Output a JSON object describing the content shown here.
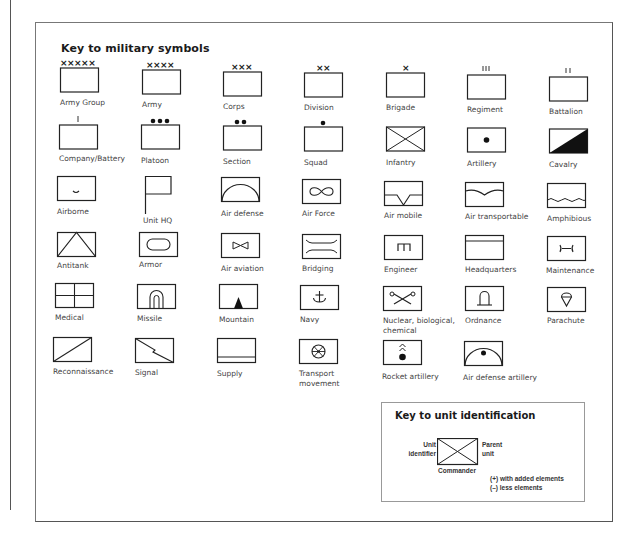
{
  "title": "Key to military symbols",
  "symbols": [
    {
      "id": "army-group",
      "label": "Army Group",
      "icon": "army-group-icon",
      "marker": "xxxxx"
    },
    {
      "id": "army",
      "label": "Army",
      "icon": "army-icon",
      "marker": "xxxx"
    },
    {
      "id": "corps",
      "label": "Corps",
      "icon": "corps-icon",
      "marker": "xxx"
    },
    {
      "id": "division",
      "label": "Division",
      "icon": "division-icon",
      "marker": "xx"
    },
    {
      "id": "brigade",
      "label": "Brigade",
      "icon": "brigade-icon",
      "marker": "x"
    },
    {
      "id": "regiment",
      "label": "Regiment",
      "icon": "regiment-icon",
      "marker": "III"
    },
    {
      "id": "battalion",
      "label": "Battalion",
      "icon": "battalion-icon",
      "marker": "II"
    },
    {
      "id": "company-battery",
      "label": "Company/Battery",
      "icon": "company-icon",
      "marker": "I"
    },
    {
      "id": "platoon",
      "label": "Platoon",
      "icon": "platoon-icon",
      "marker": "●●●"
    },
    {
      "id": "section",
      "label": "Section",
      "icon": "section-icon",
      "marker": "●●"
    },
    {
      "id": "squad",
      "label": "Squad",
      "icon": "squad-icon",
      "marker": "●"
    },
    {
      "id": "infantry",
      "label": "Infantry",
      "icon": "infantry-cross-icon"
    },
    {
      "id": "artillery",
      "label": "Artillery",
      "icon": "artillery-dot-icon"
    },
    {
      "id": "cavalry",
      "label": "Cavalry",
      "icon": "cavalry-diagonal-icon"
    },
    {
      "id": "airborne",
      "label": "Airborne",
      "icon": "airborne-icon"
    },
    {
      "id": "unit-hq",
      "label": "Unit HQ",
      "icon": "unit-hq-flag-icon"
    },
    {
      "id": "air-defense",
      "label": "Air defense",
      "icon": "air-defense-arc-icon"
    },
    {
      "id": "air-force",
      "label": "Air Force",
      "icon": "air-force-infinity-icon"
    },
    {
      "id": "air-mobile",
      "label": "Air mobile",
      "icon": "air-mobile-icon"
    },
    {
      "id": "air-transportable",
      "label": "Air transportable",
      "icon": "air-transportable-icon"
    },
    {
      "id": "amphibious",
      "label": "Amphibious",
      "icon": "amphibious-wave-icon"
    },
    {
      "id": "antitank",
      "label": "Antitank",
      "icon": "antitank-triangle-icon"
    },
    {
      "id": "armor",
      "label": "Armor",
      "icon": "armor-oval-icon"
    },
    {
      "id": "air-aviation",
      "label": "Air aviation",
      "icon": "air-aviation-bowtie-icon"
    },
    {
      "id": "bridging",
      "label": "Bridging",
      "icon": "bridging-icon"
    },
    {
      "id": "engineer",
      "label": "Engineer",
      "icon": "engineer-icon"
    },
    {
      "id": "headquarters",
      "label": "Headquarters",
      "icon": "headquarters-icon"
    },
    {
      "id": "maintenance",
      "label": "Maintenance",
      "icon": "maintenance-wrench-icon"
    },
    {
      "id": "medical",
      "label": "Medical",
      "icon": "medical-cross-icon"
    },
    {
      "id": "missile",
      "label": "Missile",
      "icon": "missile-icon"
    },
    {
      "id": "mountain",
      "label": "Mountain",
      "icon": "mountain-triangle-icon"
    },
    {
      "id": "navy",
      "label": "Navy",
      "icon": "navy-anchor-icon"
    },
    {
      "id": "nbc",
      "label": "Nuclear, biological,",
      "label2": "chemical",
      "icon": "nbc-icon"
    },
    {
      "id": "ordnance",
      "label": "Ordnance",
      "icon": "ordnance-bomb-icon"
    },
    {
      "id": "parachute",
      "label": "Parachute",
      "icon": "parachute-icon"
    },
    {
      "id": "reconnaissance",
      "label": "Reconnaissance",
      "icon": "reconnaissance-diagonal-icon"
    },
    {
      "id": "signal",
      "label": "Signal",
      "icon": "signal-lightning-icon"
    },
    {
      "id": "supply",
      "label": "Supply",
      "icon": "supply-icon"
    },
    {
      "id": "transport-movement",
      "label": "Transport",
      "label2": "movement",
      "icon": "transport-wheel-icon"
    },
    {
      "id": "rocket-artillery",
      "label": "Rocket artillery",
      "icon": "rocket-artillery-icon"
    },
    {
      "id": "air-defense-artillery",
      "label": "Air defense artillery",
      "icon": "air-defense-artillery-icon"
    }
  ],
  "unit_key": {
    "title": "Key to unit identification",
    "left_label_1": "Unit",
    "left_label_2": "identifier",
    "right_label_1": "Parent",
    "right_label_2": "unit",
    "bottom_label": "Commander",
    "note_plus": "(+) with added elements",
    "note_minus": "(–) less elements"
  },
  "colors": {
    "ink": "#2a2a2a",
    "frame": "#777777",
    "background": "#ffffff"
  }
}
